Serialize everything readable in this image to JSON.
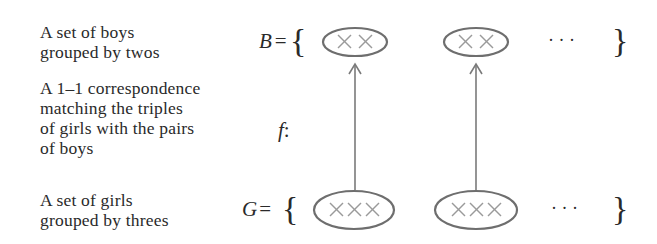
{
  "labels": {
    "boys_set": [
      "A set of boys",
      "grouped by twos"
    ],
    "correspondence": [
      "A 1–1 correspondence",
      "matching the triples",
      "of girls with the pairs",
      "of boys"
    ],
    "girls_set": [
      "A set of girls",
      "grouped by threes"
    ]
  },
  "math": {
    "boys_symbol": "B",
    "girls_symbol": "G",
    "equals": "=",
    "function_symbol": "f",
    "function_colon": ":",
    "open_brace": "{",
    "close_brace": "}",
    "ellipsis": "· · ·"
  },
  "boys_groups": [
    {
      "members": "××",
      "cx": 355,
      "cy": 42
    },
    {
      "members": "××",
      "cx": 476,
      "cy": 42
    }
  ],
  "girls_groups": [
    {
      "members": "×××",
      "cx": 354,
      "cy": 210
    },
    {
      "members": "×××",
      "cx": 476,
      "cy": 210
    }
  ],
  "colors": {
    "text": "#2a2a2a",
    "ellipse_stroke": "#6e6e6e",
    "cross": "#9a9a9a",
    "arrow": "#7a7a7a"
  }
}
